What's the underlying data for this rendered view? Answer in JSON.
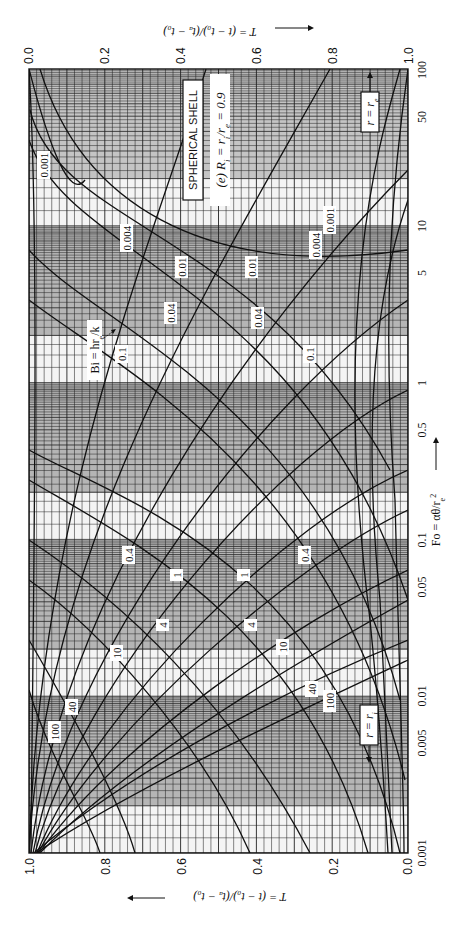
{
  "chart_data": {
    "type": "line",
    "title": "SPHERICAL SHELL",
    "subtitle": "(e) R_i = r_i/r_e = 0.9",
    "orientation": "rotated 90° (Fo axis runs vertically, log scale; T axis runs horizontally)",
    "xlabel_bottom": "T = (t − t_o)/(t_a − t_o)",
    "xlabel_top": "T = (t − t_o)/(t_a − t_o)",
    "ylabel": "Fo = αθ/r_e²",
    "parameter_label": "Bi = hr_e/k",
    "x_ticks_bottom": [
      "1.0",
      "0.8",
      "0.6",
      "0.4",
      "0.2",
      "0.0"
    ],
    "x_ticks_top": [
      "0.0",
      "0.2",
      "0.4",
      "0.6",
      "0.8",
      "1.0"
    ],
    "y_ticks": [
      "0.001",
      "0.005",
      "0.01",
      "0.05",
      "0.1",
      "0.5",
      "1",
      "5",
      "10",
      "50",
      "100"
    ],
    "xlim": [
      0.0,
      1.0
    ],
    "ylim": [
      0.001,
      100
    ],
    "yscale": "log",
    "grid": true,
    "legend": [
      {
        "name": "r = r_e",
        "position": "upper right, arrow pointing up"
      },
      {
        "name": "r = r_i",
        "position": "lower right, arrow pointing down"
      }
    ],
    "series_families": [
      {
        "name": "r = r_e",
        "bi_values": [
          "0.001",
          "0.004",
          "0.01",
          "0.04",
          "0.1",
          "0.4",
          "1",
          "4",
          "10",
          "40",
          "100"
        ]
      },
      {
        "name": "r = r_i",
        "bi_values": [
          "0.001",
          "0.004",
          "0.01",
          "0.04",
          "0.1",
          "0.4",
          "1",
          "4",
          "10",
          "40",
          "100"
        ]
      }
    ],
    "curve_labels": [
      {
        "text": "0.001",
        "family": "r = r_e",
        "approx": {
          "T": 0.87,
          "Fo": 15
        }
      },
      {
        "text": "0.001",
        "family": "r = r_i",
        "approx": {
          "T": 0.12,
          "Fo": 13
        }
      },
      {
        "text": "0.004",
        "family": "r = r_e",
        "approx": {
          "T": 0.72,
          "Fo": 8
        }
      },
      {
        "text": "0.004",
        "family": "r = r_i",
        "approx": {
          "T": 0.3,
          "Fo": 7
        }
      },
      {
        "text": "0.01",
        "family": "r = r_e",
        "approx": {
          "T": 0.58,
          "Fo": 4.5
        }
      },
      {
        "text": "0.01",
        "family": "r = r_i",
        "approx": {
          "T": 0.37,
          "Fo": 4.5
        }
      },
      {
        "text": "0.04",
        "family": "r = r_e",
        "approx": {
          "T": 0.61,
          "Fo": 1.9
        }
      },
      {
        "text": "0.04",
        "family": "r = r_i",
        "approx": {
          "T": 0.36,
          "Fo": 1.9
        }
      },
      {
        "text": "0.1",
        "family": "r = r_e",
        "approx": {
          "T": 0.73,
          "Fo": 1.1
        }
      },
      {
        "text": "0.1",
        "family": "r = r_i",
        "approx": {
          "T": 0.23,
          "Fo": 1.1
        }
      },
      {
        "text": "0.4",
        "family": "r = r_e",
        "approx": {
          "T": 0.72,
          "Fo": 0.14
        }
      },
      {
        "text": "0.4",
        "family": "r = r_i",
        "approx": {
          "T": 0.25,
          "Fo": 0.14
        }
      },
      {
        "text": "1",
        "family": "r = r_e",
        "approx": {
          "T": 0.56,
          "Fo": 0.085
        }
      },
      {
        "text": "1",
        "family": "r = r_i",
        "approx": {
          "T": 0.38,
          "Fo": 0.085
        }
      },
      {
        "text": "4",
        "family": "r = r_e",
        "approx": {
          "T": 0.58,
          "Fo": 0.033
        }
      },
      {
        "text": "4",
        "family": "r = r_i",
        "approx": {
          "T": 0.35,
          "Fo": 0.033
        }
      },
      {
        "text": "10",
        "family": "r = r_e",
        "approx": {
          "T": 0.67,
          "Fo": 0.022
        }
      },
      {
        "text": "10",
        "family": "r = r_i",
        "approx": {
          "T": 0.25,
          "Fo": 0.022
        }
      },
      {
        "text": "40",
        "family": "r = r_e",
        "approx": {
          "T": 0.26,
          "Fo": 0.012
        }
      },
      {
        "text": "40",
        "family": "r = r_i",
        "approx": {
          "T": 0.89,
          "Fo": 0.009
        }
      },
      {
        "text": "100",
        "family": "r = r_e",
        "approx": {
          "T": 0.22,
          "Fo": 0.01
        }
      },
      {
        "text": "100",
        "family": "r = r_i",
        "approx": {
          "T": 0.94,
          "Fo": 0.006
        }
      }
    ]
  },
  "labels": {
    "title": "SPHERICAL SHELL",
    "subtitle": "(e) R",
    "subtitle_sub": "i",
    "subtitle_rest": " = r",
    "subtitle_sub2": "i",
    "subtitle_rest2": "/r",
    "subtitle_sub3": "e",
    "subtitle_rest3": " = 0.9",
    "bi": "Bi = hr",
    "bi_sub": "e",
    "bi_rest": "/k",
    "re_label": "r = r",
    "re_sub": "e",
    "ri_label": "r = r",
    "ri_sub": "i",
    "top_axis_title": "T = (t − t",
    "axis_title_full": "T = (t − t₀)/(tₐ − t₀)",
    "fo_title": "Fo = αθ/r",
    "fo_sup": "2",
    "fo_sub": "e"
  },
  "ticks": {
    "bottom": [
      "1.0",
      "0.8",
      "0.6",
      "0.4",
      "0.2",
      "0.0"
    ],
    "top": [
      "0.0",
      "0.2",
      "0.4",
      "0.6",
      "0.8",
      "1.0"
    ],
    "fo": [
      "100",
      "50",
      "10",
      "5",
      "1",
      "0.5",
      "0.1",
      "0.05",
      "0.01",
      "0.005",
      "0.001"
    ]
  },
  "curve_text": {
    "e_0001": "0.001",
    "i_0001": "0.001",
    "e_0004": "0.004",
    "i_0004": "0.004",
    "e_001": "0.01",
    "i_001": "0.01",
    "e_004": "0.04",
    "i_004": "0.04",
    "e_01": "0.1",
    "i_01": "0.1",
    "e_04": "0.4",
    "i_04": "0.4",
    "e_1": "1",
    "i_1": "1",
    "e_4": "4",
    "i_4": "4",
    "e_10": "10",
    "i_10": "10",
    "e_40": "40",
    "i_40": "40",
    "e_100": "100",
    "i_100": "100"
  },
  "colors": {
    "ink": "#111111",
    "band": "#b5b5b5",
    "paper": "#ffffff"
  }
}
